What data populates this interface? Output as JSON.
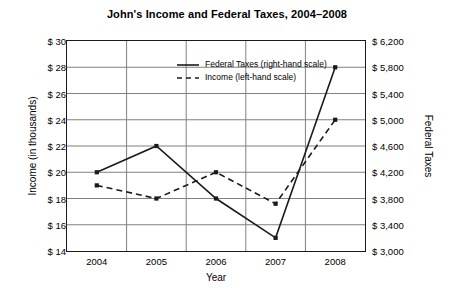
{
  "chart_data": {
    "type": "line",
    "title": "John's Income and Federal Taxes, 2004–2008",
    "xlabel": "Year",
    "ylabel": "Income (in thousands)",
    "ylabel_right": "Federal Taxes",
    "categories": [
      "2004",
      "2005",
      "2006",
      "2007",
      "2008"
    ],
    "grid": true,
    "legend_position": "upper-center",
    "yaxis_left": {
      "label": "Income (in thousands)",
      "ticks": [
        "$ 30",
        "$ 28",
        "$ 26",
        "$ 24",
        "$ 22",
        "$ 20",
        "$ 18",
        "$ 16",
        "$ 14"
      ],
      "tick_values": [
        30,
        28,
        26,
        24,
        22,
        20,
        18,
        16,
        14
      ],
      "ylim": [
        14,
        30
      ]
    },
    "yaxis_right": {
      "label": "Federal Taxes",
      "ticks": [
        "$ 6,200",
        "$ 5,800",
        "$ 5,400",
        "$ 5,000",
        "$ 4,600",
        "$ 4,200",
        "$ 3,800",
        "$ 3,400",
        "$ 3,000"
      ],
      "tick_values": [
        6200,
        5800,
        5400,
        5000,
        4600,
        4200,
        3800,
        3400,
        3000
      ],
      "ylim": [
        3000,
        6200
      ]
    },
    "series": [
      {
        "name": "Federal Taxes (right-hand scale)",
        "axis": "right",
        "style": "solid",
        "values": [
          4200,
          4600,
          3800,
          3200,
          5800
        ]
      },
      {
        "name": "Income (left-hand scale)",
        "axis": "left",
        "style": "dashed",
        "values": [
          19,
          18,
          20,
          17.6,
          24
        ]
      }
    ],
    "legend": [
      {
        "label": "Federal Taxes (right-hand scale)",
        "style": "solid"
      },
      {
        "label": "Income (left-hand scale)",
        "style": "dashed"
      }
    ],
    "colors": {
      "line": "#1a1a1a",
      "grid": "#808080",
      "axis": "#1a1a1a",
      "background": "#ffffff"
    }
  }
}
